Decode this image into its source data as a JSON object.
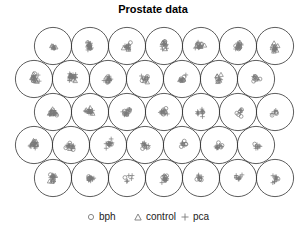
{
  "chart_data": {
    "type": "scatter",
    "subtype": "self-organizing-map hexagonal grid (circles per unit)",
    "title": "Prostate data",
    "grid": {
      "rows": 5,
      "cols": 7,
      "layout": "hexagonal"
    },
    "legend": [
      {
        "label": "bph",
        "marker": "circle"
      },
      {
        "label": "control",
        "marker": "triangle"
      },
      {
        "label": "pca",
        "marker": "plus"
      }
    ],
    "legend_position": "bottom",
    "unit_composition_estimate": [
      [
        {
          "bph": 2,
          "control": 3,
          "pca": 3
        },
        {
          "bph": 4,
          "control": 3,
          "pca": 12
        },
        {
          "bph": 2,
          "control": 4,
          "pca": 8
        },
        {
          "bph": 2,
          "control": 4,
          "pca": 10
        },
        {
          "bph": 4,
          "control": 6,
          "pca": 6
        },
        {
          "bph": 6,
          "control": 4,
          "pca": 8
        },
        {
          "bph": 1,
          "control": 10,
          "pca": 4
        }
      ],
      [
        {
          "bph": 3,
          "control": 10,
          "pca": 6
        },
        {
          "bph": 2,
          "control": 6,
          "pca": 14
        },
        {
          "bph": 5,
          "control": 4,
          "pca": 8
        },
        {
          "bph": 6,
          "control": 2,
          "pca": 4
        },
        {
          "bph": 6,
          "control": 2,
          "pca": 4
        },
        {
          "bph": 2,
          "control": 5,
          "pca": 3
        },
        {
          "bph": 7,
          "control": 0,
          "pca": 3
        }
      ],
      [
        {
          "bph": 1,
          "control": 8,
          "pca": 10
        },
        {
          "bph": 2,
          "control": 4,
          "pca": 10
        },
        {
          "bph": 8,
          "control": 1,
          "pca": 6
        },
        {
          "bph": 6,
          "control": 0,
          "pca": 8
        },
        {
          "bph": 1,
          "control": 0,
          "pca": 10
        },
        {
          "bph": 5,
          "control": 0,
          "pca": 3
        },
        {
          "bph": 4,
          "control": 0,
          "pca": 3
        }
      ],
      [
        {
          "bph": 2,
          "control": 9,
          "pca": 8
        },
        {
          "bph": 3,
          "control": 3,
          "pca": 10
        },
        {
          "bph": 4,
          "control": 0,
          "pca": 10
        },
        {
          "bph": 4,
          "control": 0,
          "pca": 8
        },
        {
          "bph": 5,
          "control": 0,
          "pca": 4
        },
        {
          "bph": 3,
          "control": 0,
          "pca": 9
        },
        {
          "bph": 1,
          "control": 0,
          "pca": 7
        }
      ],
      [
        {
          "bph": 3,
          "control": 6,
          "pca": 8
        },
        {
          "bph": 6,
          "control": 0,
          "pca": 8
        },
        {
          "bph": 1,
          "control": 0,
          "pca": 5
        },
        {
          "bph": 5,
          "control": 0,
          "pca": 10
        },
        {
          "bph": 4,
          "control": 0,
          "pca": 6
        },
        {
          "bph": 1,
          "control": 0,
          "pca": 8
        },
        {
          "bph": 1,
          "control": 0,
          "pca": 10
        }
      ]
    ],
    "xlabel": "",
    "ylabel": ""
  },
  "title": "Prostate data",
  "legend": {
    "bph": "bph",
    "control": "control",
    "pca": "pca"
  },
  "colors": {
    "circle_stroke": "#333333",
    "marker": "#7a7a7a",
    "title": "#000000"
  }
}
